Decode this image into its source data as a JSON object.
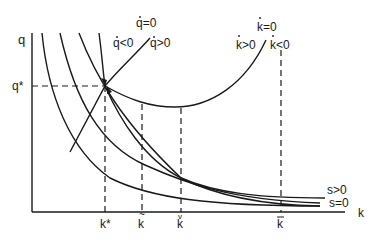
{
  "axes": {
    "y_label": "q",
    "x_label": "k"
  },
  "levels": {
    "q_star": "q*",
    "k_star": "k*",
    "k_tilde": "k",
    "k_check": "k",
    "k_bar": "k"
  },
  "loci": {
    "q_dot_zero": "q=0",
    "q_dot_regions": "q<0/q>0",
    "q_dot_left": "q<0",
    "q_dot_right": "q>0",
    "k_dot_zero": "k=0",
    "k_dot_left": "k>0",
    "k_dot_right": "k<0"
  },
  "curves": {
    "s_positive": "s>0",
    "s_zero": "s=0"
  },
  "colors": {
    "ink": "#1a1a1a",
    "background": "#ffffff"
  }
}
